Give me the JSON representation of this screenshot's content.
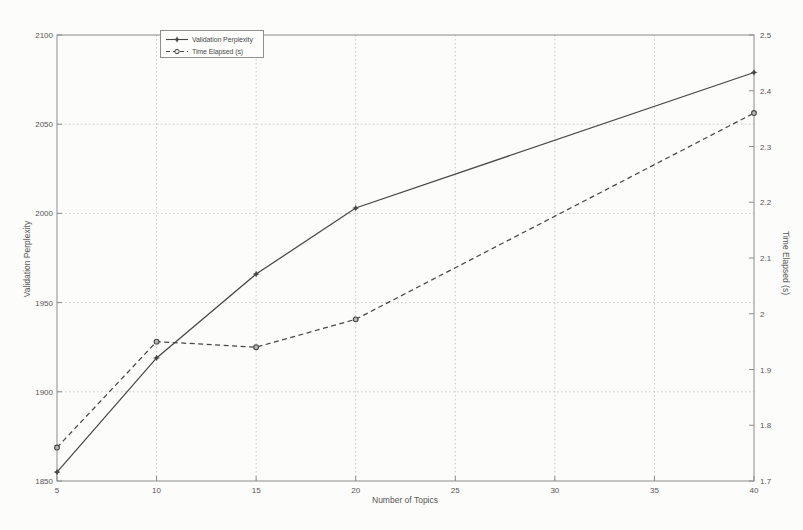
{
  "chart_data": {
    "type": "line",
    "title": "",
    "xlabel": "Number of Topics",
    "ylabel_left": "Validation Perplexity",
    "ylabel_right": "Time Elapsed (s)",
    "xlim": [
      5,
      40
    ],
    "x_ticks": [
      5,
      10,
      15,
      20,
      25,
      30,
      35,
      40
    ],
    "ylim_left": [
      1850,
      2100
    ],
    "y_ticks_left": [
      1850,
      1900,
      1950,
      2000,
      2050,
      2100
    ],
    "ylim_right": [
      1.7,
      2.5
    ],
    "y_ticks_right": [
      1.7,
      1.8,
      1.9,
      2,
      2.1,
      2.2,
      2.3,
      2.4,
      2.5
    ],
    "grid": true,
    "legend": {
      "position": "top-inside-left",
      "items": [
        "Validation Perplexity",
        "Time Elapsed (s)"
      ]
    },
    "series": [
      {
        "name": "Validation Perplexity",
        "axis": "left",
        "line_style": "solid",
        "marker": "star",
        "x": [
          5,
          10,
          15,
          20,
          40
        ],
        "values": [
          1855,
          1919,
          1966,
          2003,
          2079
        ]
      },
      {
        "name": "Time Elapsed (s)",
        "axis": "right",
        "line_style": "dashed",
        "marker": "circle",
        "x": [
          5,
          10,
          15,
          20,
          40
        ],
        "values": [
          1.76,
          1.95,
          1.94,
          1.99,
          2.36
        ]
      }
    ],
    "colors": {
      "line": "#474747",
      "grid": "#c9c9c9",
      "axis": "#8c8c8c",
      "text": "#565656",
      "background": "#fcfcfa"
    }
  }
}
